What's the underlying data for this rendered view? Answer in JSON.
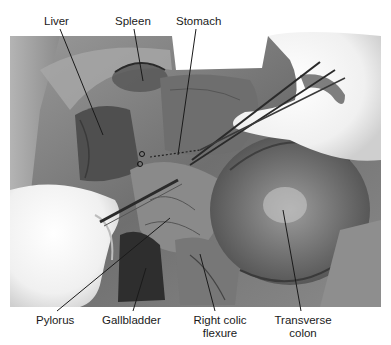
{
  "figure": {
    "kind": "labeled anatomical photograph (dissection, grayscale)",
    "colors": {
      "background": "#ffffff",
      "label_text": "#1a1a1a",
      "leader_line": "#1a1a1a"
    }
  },
  "labels": {
    "top": [
      {
        "id": "liver",
        "text": "Liver",
        "x": 58,
        "y": 15,
        "line": [
          60,
          29,
          103,
          135
        ]
      },
      {
        "id": "spleen",
        "text": "Spleen",
        "x": 134,
        "y": 15,
        "line": [
          134,
          29,
          143,
          81
        ]
      },
      {
        "id": "stomach",
        "text": "Stomach",
        "x": 200,
        "y": 15,
        "line": [
          196,
          29,
          178,
          155
        ]
      }
    ],
    "bottom": [
      {
        "id": "pylorus",
        "text": "Pylorus",
        "x": 62,
        "y": 314,
        "line": [
          57,
          311,
          170,
          218
        ]
      },
      {
        "id": "gallbladder",
        "text": "Gallbladder",
        "x": 133,
        "y": 314,
        "line": [
          133,
          311,
          146,
          268
        ]
      },
      {
        "id": "right-colic-flexure",
        "line1": "Right colic",
        "line2": "flexure",
        "x": 218,
        "y": 314,
        "line": [
          215,
          311,
          200,
          254
        ]
      },
      {
        "id": "transverse-colon",
        "line1": "Transverse",
        "line2": "colon",
        "x": 302,
        "y": 314,
        "line": [
          301,
          311,
          283,
          210
        ]
      }
    ]
  }
}
